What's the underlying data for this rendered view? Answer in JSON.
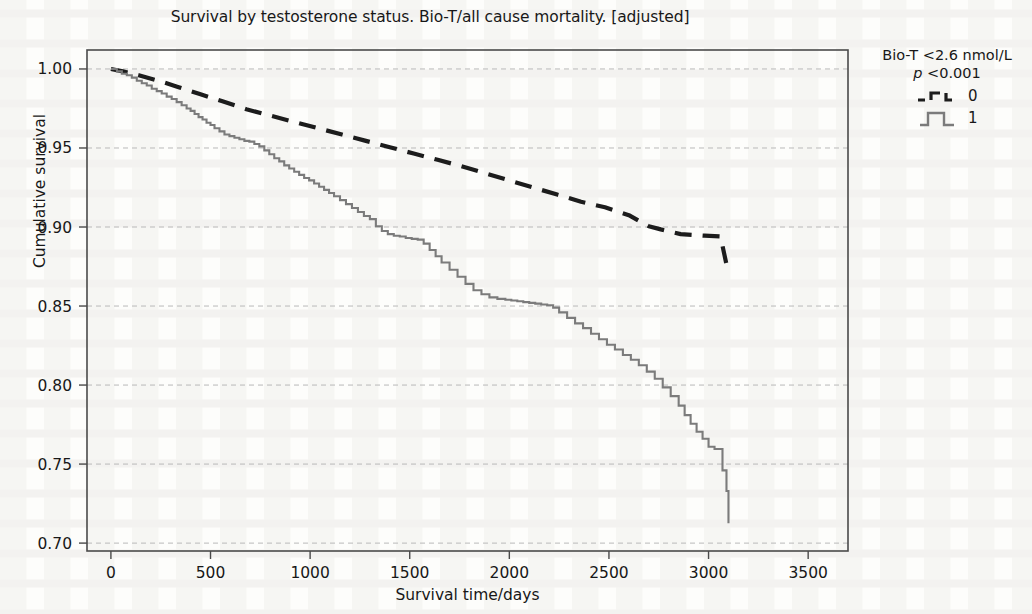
{
  "chart_data": {
    "type": "line",
    "title": "Survival by testosterone status. Bio-T/all cause mortality. [adjusted]",
    "subtitle": "",
    "xlabel": "Survival time/days",
    "ylabel": "Cumulative survival",
    "xlim": [
      -120,
      3700
    ],
    "ylim": [
      0.695,
      1.012
    ],
    "xticks": [
      0,
      500,
      1000,
      1500,
      2000,
      2500,
      3000,
      3500
    ],
    "xtick_labels": [
      "0",
      "500",
      "1000",
      "1500",
      "2000",
      "2500",
      "3000",
      "3500"
    ],
    "yticks": [
      0.7,
      0.75,
      0.8,
      0.85,
      0.9,
      0.95,
      1.0
    ],
    "ytick_labels": [
      "0.70",
      "0.75",
      "0.80",
      "0.85",
      "0.90",
      "0.95",
      "1.00"
    ],
    "grid": "horizontal-dashed",
    "grid_color": "#b9b9b9",
    "legend_position": "right",
    "legend_title": "Bio-T <2.6 nmol/L",
    "legend_pvalue_italic": "p",
    "legend_pvalue_rest": " <0.001",
    "frame_color": "#4a4a4a",
    "series": [
      {
        "name": "0",
        "label": "0",
        "style": "dashed",
        "color": "#1c1c1c",
        "key_icon": "dashed-step-line-icon",
        "x": [
          0,
          60,
          140,
          240,
          340,
          450,
          560,
          680,
          800,
          920,
          1040,
          1160,
          1280,
          1400,
          1520,
          1640,
          1760,
          1880,
          2000,
          2120,
          2240,
          2360,
          2480,
          2600,
          2700,
          2760,
          2860,
          2980,
          3060,
          3100
        ],
        "y": [
          1.0,
          0.9985,
          0.996,
          0.9925,
          0.9885,
          0.984,
          0.9795,
          0.9745,
          0.9705,
          0.9665,
          0.9625,
          0.9585,
          0.9545,
          0.9505,
          0.9465,
          0.9425,
          0.9385,
          0.934,
          0.9295,
          0.925,
          0.9205,
          0.916,
          0.9125,
          0.9075,
          0.9005,
          0.8985,
          0.8955,
          0.8945,
          0.894,
          0.8705
        ]
      },
      {
        "name": "1",
        "label": "1",
        "style": "solid-step",
        "color": "#7b7b7b",
        "key_icon": "solid-step-line-icon",
        "x": [
          0,
          30,
          55,
          80,
          105,
          130,
          155,
          180,
          205,
          230,
          255,
          280,
          305,
          330,
          355,
          380,
          400,
          420,
          440,
          460,
          480,
          500,
          520,
          545,
          570,
          595,
          620,
          645,
          670,
          695,
          720,
          745,
          770,
          795,
          820,
          845,
          870,
          895,
          920,
          945,
          970,
          995,
          1020,
          1045,
          1070,
          1095,
          1120,
          1150,
          1180,
          1210,
          1240,
          1270,
          1300,
          1330,
          1360,
          1390,
          1420,
          1450,
          1480,
          1510,
          1540,
          1570,
          1600,
          1630,
          1660,
          1700,
          1740,
          1780,
          1820,
          1860,
          1900,
          1940,
          1980,
          2010,
          2040,
          2070,
          2100,
          2130,
          2160,
          2190,
          2220,
          2250,
          2290,
          2330,
          2370,
          2410,
          2450,
          2490,
          2530,
          2570,
          2610,
          2650,
          2690,
          2730,
          2770,
          2810,
          2850,
          2880,
          2910,
          2940,
          2970,
          3000,
          3030,
          3050,
          3070,
          3090,
          3100
        ],
        "y": [
          1.0,
          0.9985,
          0.997,
          0.996,
          0.9945,
          0.9925,
          0.991,
          0.9895,
          0.9875,
          0.986,
          0.9845,
          0.9825,
          0.981,
          0.979,
          0.977,
          0.975,
          0.9735,
          0.9715,
          0.9695,
          0.968,
          0.966,
          0.9645,
          0.9625,
          0.9605,
          0.9585,
          0.9575,
          0.9565,
          0.9555,
          0.9545,
          0.954,
          0.9525,
          0.951,
          0.9485,
          0.946,
          0.9435,
          0.9415,
          0.939,
          0.937,
          0.935,
          0.933,
          0.931,
          0.9295,
          0.9275,
          0.9255,
          0.9235,
          0.9215,
          0.9195,
          0.917,
          0.9145,
          0.912,
          0.9095,
          0.907,
          0.905,
          0.9005,
          0.8975,
          0.8955,
          0.8945,
          0.894,
          0.893,
          0.8925,
          0.892,
          0.8895,
          0.8855,
          0.8815,
          0.8775,
          0.873,
          0.8685,
          0.864,
          0.86,
          0.8575,
          0.8555,
          0.8545,
          0.854,
          0.8535,
          0.853,
          0.8525,
          0.852,
          0.8515,
          0.851,
          0.8505,
          0.849,
          0.846,
          0.8425,
          0.839,
          0.836,
          0.8325,
          0.829,
          0.8255,
          0.8225,
          0.819,
          0.816,
          0.8125,
          0.8085,
          0.804,
          0.7985,
          0.793,
          0.787,
          0.781,
          0.7755,
          0.7705,
          0.766,
          0.761,
          0.7595,
          0.7595,
          0.746,
          0.733,
          0.7125
        ]
      }
    ]
  },
  "legend": {
    "title": "Bio-T <2.6 nmol/L",
    "pvalue_symbol": "p",
    "pvalue_text": " <0.001",
    "items": [
      {
        "label": "0",
        "icon": "dashed-step-line-icon"
      },
      {
        "label": "1",
        "icon": "solid-step-line-icon"
      }
    ]
  }
}
